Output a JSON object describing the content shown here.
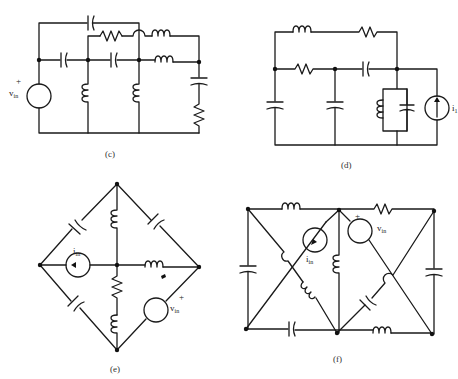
{
  "figure": {
    "panels": [
      {
        "id": "c",
        "caption": "(c)",
        "source_label": "v",
        "source_sub": "in",
        "source_polarity": "+",
        "source_type": "voltage"
      },
      {
        "id": "d",
        "caption": "(d)",
        "source_label": "i",
        "source_sub": "1",
        "source_type": "current"
      },
      {
        "id": "e",
        "caption": "(e)",
        "current_label": "i",
        "current_sub": "in",
        "voltage_label": "v",
        "voltage_sub": "in",
        "voltage_polarity": "+"
      },
      {
        "id": "f",
        "caption": "(f)",
        "current_label": "i",
        "current_sub": "in",
        "voltage_label": "v",
        "voltage_sub": "in",
        "voltage_polarity": "+"
      }
    ]
  }
}
